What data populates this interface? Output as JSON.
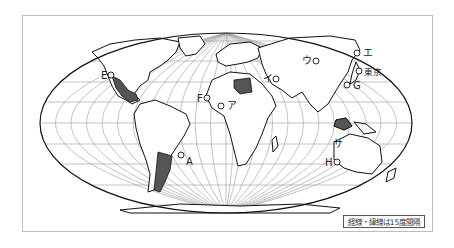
{
  "map": {
    "projection": "world map (elliptical / Robinson-like), Pacific-Atlantic centered on Atlantic",
    "graticule_note": "経線・緯線は15度間隔",
    "shaded_regions": [
      "Mexico",
      "Libya",
      "Argentina",
      "Java / Indonesia (Sunda)"
    ],
    "colors": {
      "land_fill": "#ffffff",
      "shaded_fill": "#555555",
      "coastline": "#111111",
      "graticule": "#9a9a9a",
      "frame": "#bdbdbd"
    }
  },
  "points": {
    "E": {
      "label": "E"
    },
    "F": {
      "label": "F"
    },
    "A": {
      "label": "A"
    },
    "G": {
      "label": "G"
    },
    "H": {
      "label": "H"
    },
    "a": {
      "label": "ア"
    },
    "i": {
      "label": "イ"
    },
    "u": {
      "label": "ウ"
    },
    "e": {
      "label": "エ"
    },
    "tokyo": {
      "label": "東京"
    },
    "sa": {
      "label": "サ"
    }
  },
  "legend": {
    "text": "経線・緯線は15度間隔"
  }
}
